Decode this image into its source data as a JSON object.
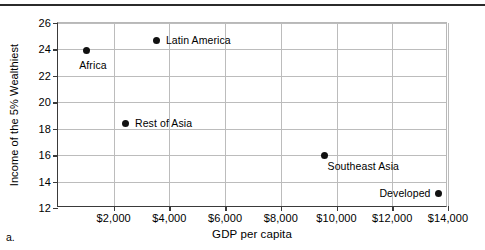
{
  "figure": {
    "caption_label": "a."
  },
  "chart_data": {
    "type": "scatter",
    "title": "",
    "xlabel": "GDP per capita",
    "ylabel": "Income of the 5% Wealthiest",
    "xlim": [
      0,
      14000
    ],
    "ylim": [
      12,
      26
    ],
    "grid": true,
    "legend": "none",
    "x_ticks": [
      {
        "value": 2000,
        "label": "$2,000"
      },
      {
        "value": 4000,
        "label": "$4,000"
      },
      {
        "value": 6000,
        "label": "$6,000"
      },
      {
        "value": 8000,
        "label": "$8,000"
      },
      {
        "value": 10000,
        "label": "$10,000"
      },
      {
        "value": 12000,
        "label": "$12,000"
      },
      {
        "value": 14000,
        "label": "$14,000"
      }
    ],
    "y_ticks": [
      {
        "value": 12,
        "label": "12"
      },
      {
        "value": 14,
        "label": "14"
      },
      {
        "value": 16,
        "label": "16"
      },
      {
        "value": 18,
        "label": "18"
      },
      {
        "value": 20,
        "label": "20"
      },
      {
        "value": 22,
        "label": "22"
      },
      {
        "value": 24,
        "label": "24"
      },
      {
        "value": 26,
        "label": "26"
      }
    ],
    "points": [
      {
        "label": "Africa",
        "x": 1040,
        "y": 23.9,
        "label_pos": "below"
      },
      {
        "label": "Latin America",
        "x": 3550,
        "y": 24.7,
        "label_pos": "right"
      },
      {
        "label": "Rest of Asia",
        "x": 2440,
        "y": 18.4,
        "label_pos": "right"
      },
      {
        "label": "Southeast Asia",
        "x": 9570,
        "y": 16.0,
        "label_pos": "below-right"
      },
      {
        "label": "Developed",
        "x": 13660,
        "y": 13.1,
        "label_pos": "left"
      }
    ]
  }
}
